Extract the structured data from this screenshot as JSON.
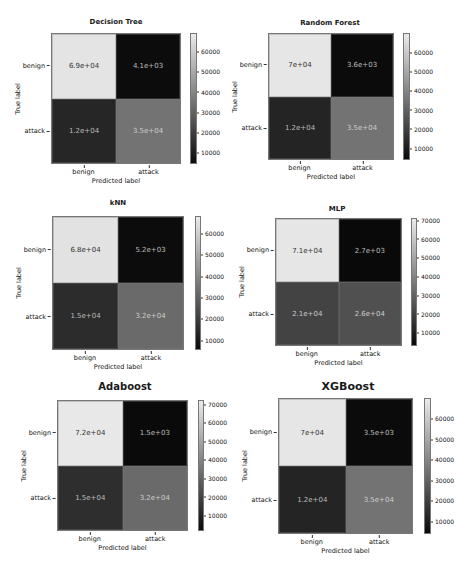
{
  "chart_data": [
    {
      "type": "heatmap",
      "title": "Decision Tree",
      "xlabel": "Predicted label",
      "ylabel": "True label",
      "x_categories": [
        "benign",
        "attack"
      ],
      "y_categories": [
        "benign",
        "attack"
      ],
      "values": [
        [
          69000,
          4100
        ],
        [
          12000,
          35000
        ]
      ],
      "annotations": [
        [
          "6.9e+04",
          "4.1e+03"
        ],
        [
          "1.2e+04",
          "3.5e+04"
        ]
      ],
      "colorbar_ticks": [
        "60000",
        "50000",
        "40000",
        "30000",
        "20000",
        "10000"
      ],
      "colormap": "gray"
    },
    {
      "type": "heatmap",
      "title": "Random Forest",
      "xlabel": "Predicted label",
      "ylabel": "True label",
      "x_categories": [
        "benign",
        "attack"
      ],
      "y_categories": [
        "benign",
        "attack"
      ],
      "values": [
        [
          70000,
          3600
        ],
        [
          12000,
          35000
        ]
      ],
      "annotations": [
        [
          "7e+04",
          "3.6e+03"
        ],
        [
          "1.2e+04",
          "3.5e+04"
        ]
      ],
      "colorbar_ticks": [
        "60000",
        "50000",
        "40000",
        "30000",
        "20000",
        "10000"
      ],
      "colormap": "gray"
    },
    {
      "type": "heatmap",
      "title": "kNN",
      "xlabel": "Predicted label",
      "ylabel": "True label",
      "x_categories": [
        "benign",
        "attack"
      ],
      "y_categories": [
        "benign",
        "attack"
      ],
      "values": [
        [
          68000,
          5200
        ],
        [
          15000,
          32000
        ]
      ],
      "annotations": [
        [
          "6.8e+04",
          "5.2e+03"
        ],
        [
          "1.5e+04",
          "3.2e+04"
        ]
      ],
      "colorbar_ticks": [
        "60000",
        "50000",
        "40000",
        "30000",
        "20000",
        "10000"
      ],
      "colormap": "gray"
    },
    {
      "type": "heatmap",
      "title": "MLP",
      "xlabel": "Predicted label",
      "ylabel": "True label",
      "x_categories": [
        "benign",
        "attack"
      ],
      "y_categories": [
        "benign",
        "attack"
      ],
      "values": [
        [
          71000,
          2700
        ],
        [
          21000,
          26000
        ]
      ],
      "annotations": [
        [
          "7.1e+04",
          "2.7e+03"
        ],
        [
          "2.1e+04",
          "2.6e+04"
        ]
      ],
      "colorbar_ticks": [
        "70000",
        "60000",
        "50000",
        "40000",
        "30000",
        "20000",
        "10000"
      ],
      "colormap": "gray"
    },
    {
      "type": "heatmap",
      "title": "Adaboost",
      "xlabel": "Predicted label",
      "ylabel": "True label",
      "x_categories": [
        "benign",
        "attack"
      ],
      "y_categories": [
        "benign",
        "attack"
      ],
      "values": [
        [
          72000,
          1500
        ],
        [
          15000,
          32000
        ]
      ],
      "annotations": [
        [
          "7.2e+04",
          "1.5e+03"
        ],
        [
          "1.5e+04",
          "3.2e+04"
        ]
      ],
      "colorbar_ticks": [
        "70000",
        "60000",
        "50000",
        "40000",
        "30000",
        "20000",
        "10000"
      ],
      "colormap": "gray"
    },
    {
      "type": "heatmap",
      "title": "XGBoost",
      "xlabel": "Predicted label",
      "ylabel": "True label",
      "x_categories": [
        "benign",
        "attack"
      ],
      "y_categories": [
        "benign",
        "attack"
      ],
      "values": [
        [
          70000,
          3500
        ],
        [
          12000,
          35000
        ]
      ],
      "annotations": [
        [
          "7e+04",
          "3.5e+03"
        ],
        [
          "1.2e+04",
          "3.5e+04"
        ]
      ],
      "colorbar_ticks": [
        "60000",
        "50000",
        "40000",
        "30000",
        "20000",
        "10000"
      ],
      "colormap": "gray"
    }
  ],
  "panels": [
    {
      "title": "Decision Tree",
      "xlabel": "Predicted label",
      "ylabel": "True label",
      "row_labels": [
        "benign",
        "attack"
      ],
      "col_labels": [
        "benign",
        "attack"
      ],
      "cells": [
        "6.9e+04",
        "4.1e+03",
        "1.2e+04",
        "3.5e+04"
      ],
      "cell_colors": [
        "#e4e4e4",
        "#0c0c0c",
        "#262626",
        "#737373"
      ],
      "text_colors": [
        "#333333",
        "#bbbbbb",
        "#bbbbbb",
        "#cccccc"
      ],
      "cbar_ticks": [
        "60000",
        "50000",
        "40000",
        "30000",
        "20000",
        "10000"
      ]
    },
    {
      "title": "Random Forest",
      "xlabel": "Predicted label",
      "ylabel": "True label",
      "row_labels": [
        "benign",
        "attack"
      ],
      "col_labels": [
        "benign",
        "attack"
      ],
      "cells": [
        "7e+04",
        "3.6e+03",
        "1.2e+04",
        "3.5e+04"
      ],
      "cell_colors": [
        "#e6e6e6",
        "#0b0b0b",
        "#242424",
        "#737373"
      ],
      "text_colors": [
        "#333333",
        "#bbbbbb",
        "#bbbbbb",
        "#cccccc"
      ],
      "cbar_ticks": [
        "60000",
        "50000",
        "40000",
        "30000",
        "20000",
        "10000"
      ]
    },
    {
      "title": "kNN",
      "xlabel": "Predicted label",
      "ylabel": "True label",
      "row_labels": [
        "benign",
        "attack"
      ],
      "col_labels": [
        "benign",
        "attack"
      ],
      "cells": [
        "6.8e+04",
        "5.2e+03",
        "1.5e+04",
        "3.2e+04"
      ],
      "cell_colors": [
        "#e2e2e2",
        "#0c0c0c",
        "#2c2c2c",
        "#6a6a6a"
      ],
      "text_colors": [
        "#333333",
        "#bbbbbb",
        "#bbbbbb",
        "#cccccc"
      ],
      "cbar_ticks": [
        "60000",
        "50000",
        "40000",
        "30000",
        "20000",
        "10000"
      ]
    },
    {
      "title": "MLP",
      "xlabel": "Predicted label",
      "ylabel": "True label",
      "row_labels": [
        "benign",
        "attack"
      ],
      "col_labels": [
        "benign",
        "attack"
      ],
      "cells": [
        "7.1e+04",
        "2.7e+03",
        "2.1e+04",
        "2.6e+04"
      ],
      "cell_colors": [
        "#e6e6e6",
        "#090909",
        "#434343",
        "#505050"
      ],
      "text_colors": [
        "#333333",
        "#bbbbbb",
        "#cccccc",
        "#cccccc"
      ],
      "cbar_ticks": [
        "70000",
        "60000",
        "50000",
        "40000",
        "30000",
        "20000",
        "10000"
      ]
    },
    {
      "title": "Adaboost",
      "xlabel": "Predicted label",
      "ylabel": "True label",
      "row_labels": [
        "benign",
        "attack"
      ],
      "col_labels": [
        "benign",
        "attack"
      ],
      "cells": [
        "7.2e+04",
        "1.5e+03",
        "1.5e+04",
        "3.2e+04"
      ],
      "cell_colors": [
        "#e8e8e8",
        "#0a0a0a",
        "#2e2e2e",
        "#6a6a6a"
      ],
      "text_colors": [
        "#333333",
        "#bbbbbb",
        "#bbbbbb",
        "#cccccc"
      ],
      "cbar_ticks": [
        "70000",
        "60000",
        "50000",
        "40000",
        "30000",
        "20000",
        "10000"
      ]
    },
    {
      "title": "XGBoost",
      "xlabel": "Predicted label",
      "ylabel": "True label",
      "row_labels": [
        "benign",
        "attack"
      ],
      "col_labels": [
        "benign",
        "attack"
      ],
      "cells": [
        "7e+04",
        "3.5e+03",
        "1.2e+04",
        "3.5e+04"
      ],
      "cell_colors": [
        "#e6e6e6",
        "#0b0b0b",
        "#242424",
        "#737373"
      ],
      "text_colors": [
        "#333333",
        "#bbbbbb",
        "#bbbbbb",
        "#cccccc"
      ],
      "cbar_ticks": [
        "60000",
        "50000",
        "40000",
        "30000",
        "20000",
        "10000"
      ]
    }
  ]
}
